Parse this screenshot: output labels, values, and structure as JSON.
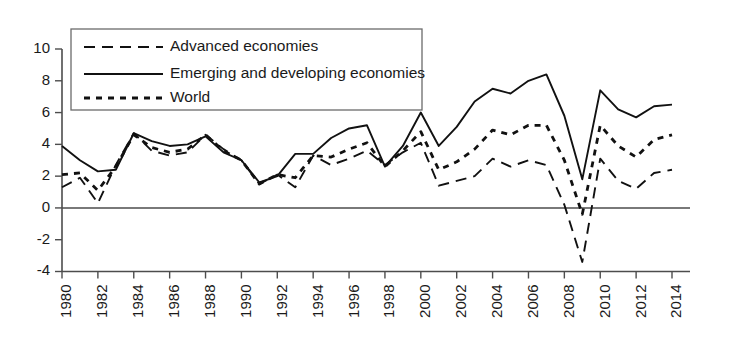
{
  "chart_data": {
    "type": "line",
    "title": "",
    "subtitle": "",
    "xlabel": "",
    "ylabel": "",
    "grid": false,
    "legend_position": "top-left",
    "xlim": [
      1980,
      2014
    ],
    "ylim": [
      -4,
      10
    ],
    "y_ticks": [
      -4,
      -2,
      0,
      2,
      4,
      6,
      8,
      10
    ],
    "y_tick_labels": [
      "-4",
      "-2",
      "0",
      "2",
      "4",
      "6",
      "8",
      "10"
    ],
    "x": [
      1980,
      1981,
      1982,
      1983,
      1984,
      1985,
      1986,
      1987,
      1988,
      1989,
      1990,
      1991,
      1992,
      1993,
      1994,
      1995,
      1996,
      1997,
      1998,
      1999,
      2000,
      2001,
      2002,
      2003,
      2004,
      2005,
      2006,
      2007,
      2008,
      2009,
      2010,
      2011,
      2012,
      2013,
      2014
    ],
    "x_tick_years": [
      1980,
      1982,
      1984,
      1986,
      1988,
      1990,
      1992,
      1994,
      1996,
      1998,
      2000,
      2002,
      2004,
      2006,
      2008,
      2010,
      2012,
      2014
    ],
    "x_tick_labels": [
      "1980",
      "1982",
      "1984",
      "1986",
      "1988",
      "1990",
      "1992",
      "1994",
      "1996",
      "1998",
      "2000",
      "2002",
      "2004",
      "2006",
      "2008",
      "2010",
      "2012",
      "2014"
    ],
    "series": [
      {
        "name": "Advanced economies",
        "style": "dashed",
        "dasharray": "11,7",
        "width": 1.9,
        "values": [
          1.3,
          1.9,
          0.3,
          2.7,
          4.7,
          3.6,
          3.3,
          3.5,
          4.6,
          3.7,
          3.0,
          1.5,
          2.1,
          1.3,
          3.3,
          2.7,
          3.1,
          3.6,
          2.7,
          3.5,
          4.1,
          1.4,
          1.7,
          2.0,
          3.1,
          2.6,
          3.0,
          2.7,
          0.2,
          -3.4,
          3.1,
          1.7,
          1.2,
          2.2,
          2.4
        ]
      },
      {
        "name": "Emerging and developing economies",
        "style": "solid",
        "dasharray": "",
        "width": 1.9,
        "values": [
          3.9,
          3.0,
          2.3,
          2.4,
          4.7,
          4.2,
          3.9,
          4.0,
          4.5,
          3.5,
          3.0,
          1.6,
          2.0,
          3.4,
          3.4,
          4.4,
          5.0,
          5.2,
          2.6,
          3.9,
          6.0,
          3.9,
          5.1,
          6.7,
          7.5,
          7.2,
          8.0,
          8.4,
          5.8,
          1.8,
          7.4,
          6.2,
          5.7,
          6.4,
          6.5
        ]
      },
      {
        "name": "World",
        "style": "dotted",
        "dasharray": "6,6",
        "width": 2.8,
        "values": [
          2.1,
          2.2,
          1.1,
          2.6,
          4.6,
          3.8,
          3.5,
          3.7,
          4.6,
          3.6,
          3.0,
          1.5,
          2.1,
          1.9,
          3.3,
          3.2,
          3.7,
          4.1,
          2.6,
          3.6,
          4.8,
          2.4,
          2.9,
          3.7,
          4.9,
          4.6,
          5.2,
          5.2,
          3.0,
          -0.4,
          5.2,
          3.9,
          3.2,
          4.3,
          4.6
        ]
      }
    ]
  },
  "legend": {
    "entries": [
      {
        "label": "Advanced economies"
      },
      {
        "label": "Emerging and developing economies"
      },
      {
        "label": "World"
      }
    ]
  }
}
